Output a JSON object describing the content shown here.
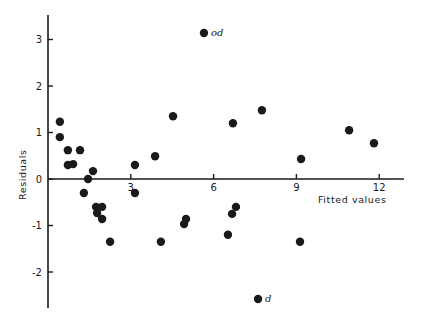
{
  "chart_data": {
    "type": "scatter",
    "title": "",
    "xlabel": "Fitted values",
    "ylabel": "Residuals",
    "xlim": [
      0,
      12.8
    ],
    "ylim": [
      -2.8,
      3.6
    ],
    "x_ticks": [
      3,
      6,
      9,
      12
    ],
    "x_tick_labels": [
      "3",
      "6",
      "9",
      "12"
    ],
    "y_ticks": [
      3,
      2,
      1,
      0,
      -1,
      -2
    ],
    "y_tick_labels": [
      "3",
      "2",
      "1",
      "0",
      "-1",
      "-2"
    ],
    "grid": false,
    "legend": null,
    "points": [
      {
        "x": 0.43,
        "y": 1.23
      },
      {
        "x": 0.43,
        "y": 0.9
      },
      {
        "x": 0.72,
        "y": 0.62
      },
      {
        "x": 1.16,
        "y": 0.62
      },
      {
        "x": 0.72,
        "y": 0.3
      },
      {
        "x": 0.91,
        "y": 0.32
      },
      {
        "x": 1.3,
        "y": -0.3
      },
      {
        "x": 1.45,
        "y": 0.0
      },
      {
        "x": 1.63,
        "y": 0.17
      },
      {
        "x": 1.74,
        "y": -0.6
      },
      {
        "x": 1.96,
        "y": -0.6
      },
      {
        "x": 1.78,
        "y": -0.73
      },
      {
        "x": 1.96,
        "y": -0.86
      },
      {
        "x": 2.25,
        "y": -1.35
      },
      {
        "x": 3.15,
        "y": 0.3
      },
      {
        "x": 3.15,
        "y": -0.3
      },
      {
        "x": 3.88,
        "y": 0.49
      },
      {
        "x": 4.09,
        "y": -1.35
      },
      {
        "x": 4.53,
        "y": 1.35
      },
      {
        "x": 4.93,
        "y": -0.97
      },
      {
        "x": 5.0,
        "y": -0.86
      },
      {
        "x": 5.65,
        "y": 3.14,
        "label": "od"
      },
      {
        "x": 6.7,
        "y": 1.2
      },
      {
        "x": 6.52,
        "y": -1.2
      },
      {
        "x": 6.67,
        "y": -0.75
      },
      {
        "x": 6.81,
        "y": -0.6
      },
      {
        "x": 7.75,
        "y": 1.48
      },
      {
        "x": 7.61,
        "y": -2.58,
        "label": "d"
      },
      {
        "x": 9.13,
        "y": -1.35
      },
      {
        "x": 9.17,
        "y": 0.43
      },
      {
        "x": 10.91,
        "y": 1.05
      },
      {
        "x": 11.81,
        "y": 0.77
      }
    ],
    "annotations": [
      {
        "text": "od",
        "x": 5.65,
        "y": 3.14
      },
      {
        "text": "d",
        "x": 7.61,
        "y": -2.58
      }
    ]
  },
  "layout": {
    "origin_px": [
      48,
      179
    ],
    "x_px_per_unit": 27.6,
    "y_px_per_unit": 46.5,
    "x_axis_end_px": 404,
    "y_axis_top_px": 15,
    "y_axis_bottom_px": 308,
    "point_radius": 4.2,
    "color": "#1a1a1a"
  }
}
